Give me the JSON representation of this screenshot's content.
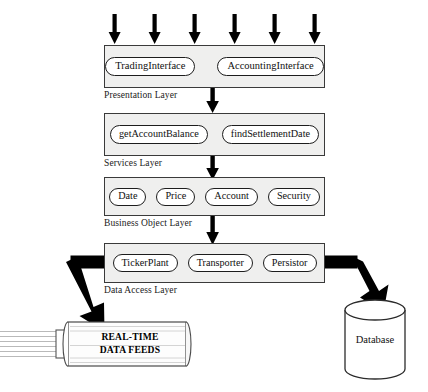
{
  "diagram": {
    "top_arrows": {
      "count": 6,
      "name": "incoming-request-arrows"
    },
    "layers": [
      {
        "id": "presentation",
        "label": "Presentation Layer",
        "components": [
          "TradingInterface",
          "AccountingInterface"
        ]
      },
      {
        "id": "services",
        "label": "Services Layer",
        "components": [
          "getAccountBalance",
          "findSettlementDate"
        ]
      },
      {
        "id": "business-object",
        "label": "Business Object Layer",
        "components": [
          "Date",
          "Price",
          "Account",
          "Security"
        ]
      },
      {
        "id": "data-access",
        "label": "Data Access Layer",
        "components": [
          "TickerPlant",
          "Transporter",
          "Persistor"
        ]
      }
    ],
    "endpoints": [
      {
        "id": "real-time-data-feeds",
        "shape": "pipe-cylinder",
        "line1": "REAL-TIME",
        "line2": "DATA FEEDS"
      },
      {
        "id": "database",
        "shape": "database-cylinder",
        "label": "Database"
      }
    ],
    "colors": {
      "layer_fill": "#efefee",
      "layer_border": "#3a3a3a",
      "pill_fill": "#ffffff",
      "pill_border": "#1d1d1d",
      "arrow": "#000000",
      "text": "#111111"
    }
  }
}
